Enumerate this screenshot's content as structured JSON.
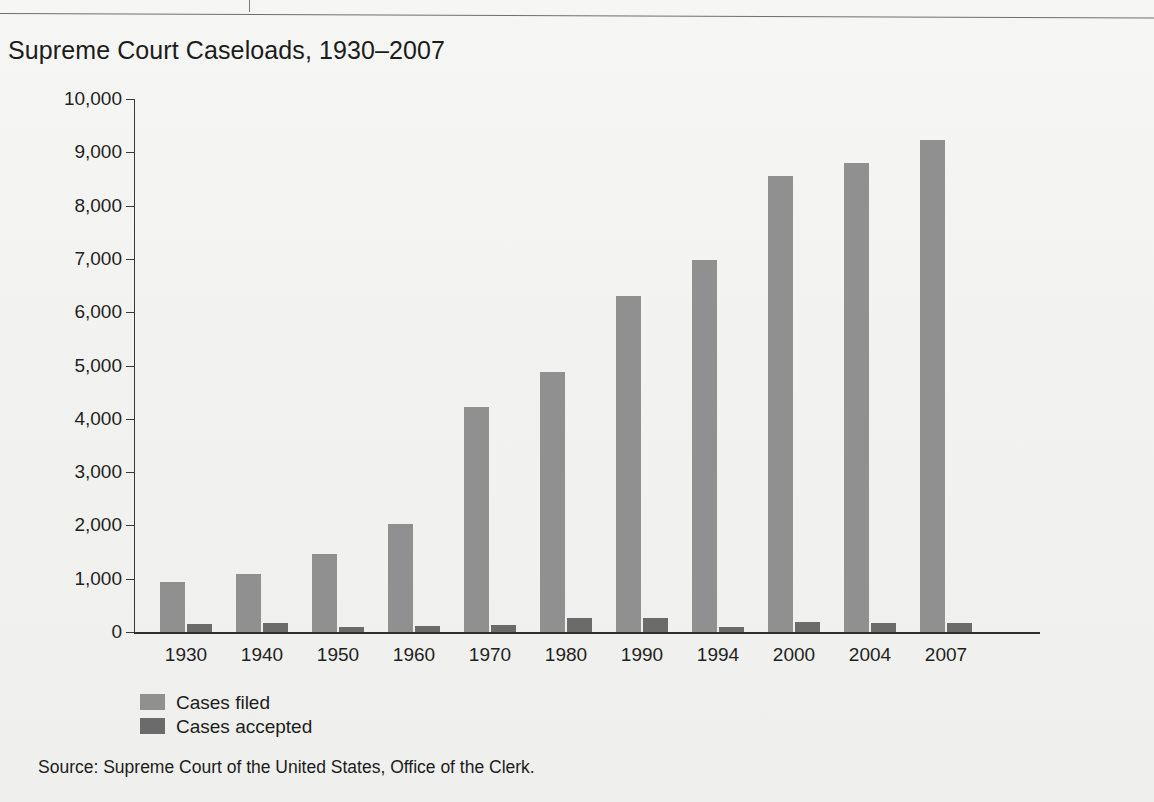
{
  "figure": {
    "title": "Supreme Court Caseloads, 1930–2007",
    "source": "Source: Supreme Court of the United States, Office of the Clerk."
  },
  "colors": {
    "series_filed": "#909090",
    "series_accepted": "#6b6b6b",
    "axis": "#2e2e2e",
    "text": "#1c1c1c",
    "background": "#f3f3f1"
  },
  "chart_data": {
    "type": "bar",
    "title": "Supreme Court Caseloads, 1930–2007",
    "xlabel": "",
    "ylabel": "",
    "ylim": [
      0,
      10000
    ],
    "ytick_labels": [
      "10,000",
      "9,000",
      "8,000",
      "7,000",
      "6,000",
      "5,000",
      "4,000",
      "3,000",
      "2,000",
      "1,000",
      "0"
    ],
    "yticks": [
      10000,
      9000,
      8000,
      7000,
      6000,
      5000,
      4000,
      3000,
      2000,
      1000,
      0
    ],
    "grid": false,
    "legend_position": "below-axis-left",
    "categories": [
      "1930",
      "1940",
      "1950",
      "1960",
      "1970",
      "1980",
      "1990",
      "1994",
      "2000",
      "2004",
      "2007"
    ],
    "series": [
      {
        "name": "Cases filed",
        "color": "#909090",
        "values": [
          930,
          1090,
          1460,
          2030,
          4230,
          4880,
          6300,
          6980,
          8550,
          8800,
          9230
        ]
      },
      {
        "name": "Cases accepted",
        "color": "#6b6b6b",
        "values": [
          150,
          160,
          85,
          120,
          125,
          270,
          270,
          100,
          190,
          165,
          170
        ]
      }
    ],
    "source": "Source: Supreme Court of the United States, Office of the Clerk."
  }
}
